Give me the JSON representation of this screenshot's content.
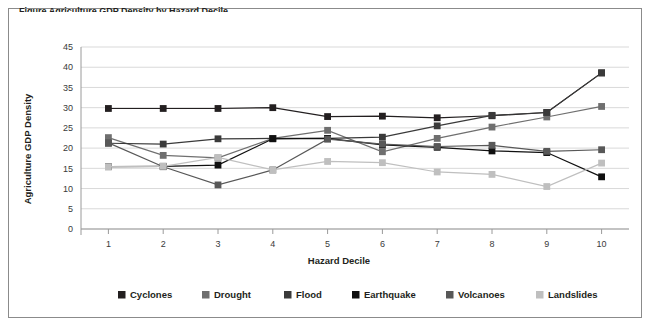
{
  "figure": {
    "caption_sliver": "Figure   Agriculture GDP Density by Hazard Decile"
  },
  "chart_data": {
    "type": "line",
    "title": "",
    "xlabel": "Hazard Decile",
    "ylabel": "Agriculture GDP Density",
    "categories": [
      "1",
      "2",
      "3",
      "4",
      "5",
      "6",
      "7",
      "8",
      "9",
      "10"
    ],
    "x": [
      1,
      2,
      3,
      4,
      5,
      6,
      7,
      8,
      9,
      10
    ],
    "xlim": [
      0.5,
      10.5
    ],
    "ylim": [
      0,
      45
    ],
    "yticks": [
      0,
      5,
      10,
      15,
      20,
      25,
      30,
      35,
      40,
      45
    ],
    "grid": true,
    "legend_position": "bottom",
    "series": [
      {
        "name": "Cyclones",
        "color": "#231f20",
        "values": [
          29.8,
          29.8,
          29.8,
          30.0,
          27.8,
          27.9,
          27.5,
          28.0,
          28.8,
          38.6
        ]
      },
      {
        "name": "Drought",
        "color": "#6f6f6f",
        "values": [
          22.6,
          18.2,
          17.6,
          22.4,
          24.4,
          19.1,
          22.4,
          25.2,
          27.7,
          30.3
        ]
      },
      {
        "name": "Flood",
        "color": "#3a3a3a",
        "values": [
          21.2,
          21.0,
          22.3,
          22.4,
          22.4,
          22.7,
          25.5,
          28.1,
          28.8,
          38.6
        ]
      },
      {
        "name": "Earthquake",
        "color": "#101010",
        "values": [
          15.4,
          15.5,
          15.8,
          22.3,
          22.4,
          20.8,
          20.2,
          19.3,
          18.9,
          12.9
        ]
      },
      {
        "name": "Volcanoes",
        "color": "#585858",
        "values": [
          21.3,
          15.4,
          10.9,
          14.6,
          22.2,
          21.0,
          20.4,
          20.7,
          19.2,
          19.6
        ]
      },
      {
        "name": "Landslides",
        "color": "#bfbfbf",
        "values": [
          15.4,
          15.5,
          17.7,
          14.6,
          16.7,
          16.4,
          14.1,
          13.5,
          10.5,
          16.3
        ]
      }
    ]
  }
}
